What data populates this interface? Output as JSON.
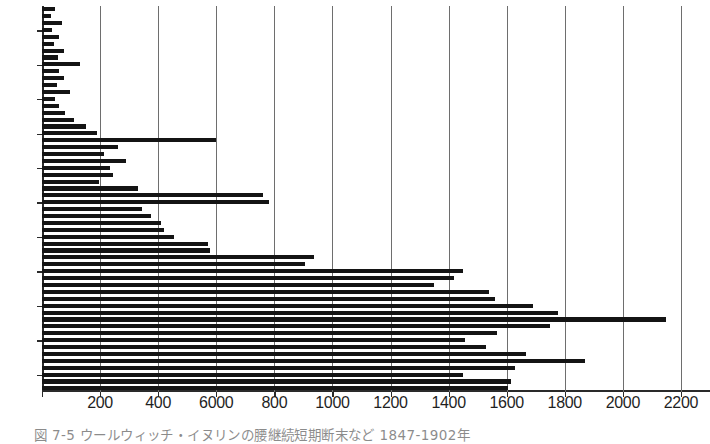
{
  "figure": {
    "caption": "図 7-5  ウールウィッチ・イヌリンの腰継続短期断末など 1847-1902年"
  },
  "chart_data": {
    "type": "bar",
    "orientation": "horizontal",
    "title": "",
    "xlabel": "",
    "ylabel": "",
    "xlim": [
      0,
      2300
    ],
    "ylim": [
      1847,
      1902
    ],
    "grid": true,
    "grid_axis": "x",
    "legend": "none",
    "xticks": [
      0,
      200,
      400,
      600,
      800,
      1000,
      1200,
      1400,
      1600,
      1800,
      2000,
      2200
    ],
    "xtick_labels": [
      "",
      "200",
      "400",
      "6000",
      "800",
      "1000",
      "1200",
      "1400",
      "1600",
      "1800",
      "2000",
      "2200"
    ],
    "xtick_label_note": "The 600 tick is printed as '6000' in the original scanned figure.",
    "yticks": [
      1850,
      1855,
      1860,
      1865,
      1870,
      1875,
      1880,
      1885,
      1890,
      1895,
      1900
    ],
    "ytick_labels": [
      "1850",
      "55",
      "60",
      "65",
      "70",
      "75",
      "80",
      "85",
      "90",
      "95",
      "1900"
    ],
    "bar_color": "#141414",
    "categories": [
      1847,
      1848,
      1849,
      1850,
      1851,
      1852,
      1853,
      1854,
      1855,
      1856,
      1857,
      1858,
      1859,
      1860,
      1861,
      1862,
      1863,
      1864,
      1865,
      1866,
      1867,
      1868,
      1869,
      1870,
      1871,
      1872,
      1873,
      1874,
      1875,
      1876,
      1877,
      1878,
      1879,
      1880,
      1881,
      1882,
      1883,
      1884,
      1885,
      1886,
      1887,
      1888,
      1889,
      1890,
      1891,
      1892,
      1893,
      1894,
      1895,
      1896,
      1897,
      1898,
      1899,
      1900,
      1901,
      1902
    ],
    "values": [
      45,
      30,
      70,
      35,
      60,
      40,
      75,
      55,
      130,
      60,
      75,
      50,
      95,
      45,
      60,
      80,
      110,
      150,
      190,
      600,
      260,
      215,
      290,
      235,
      245,
      195,
      330,
      760,
      780,
      345,
      375,
      410,
      420,
      455,
      570,
      580,
      935,
      905,
      1450,
      1420,
      1350,
      1540,
      1560,
      1690,
      1775,
      2150,
      1750,
      1565,
      1455,
      1530,
      1665,
      1870,
      1630,
      1450,
      1615,
      1605
    ]
  }
}
